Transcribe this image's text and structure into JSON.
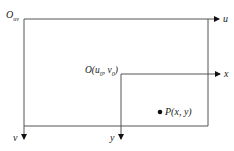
{
  "diagram": {
    "type": "coordinate-frames",
    "world_frame": {
      "origin_label": "O",
      "origin_subscript": "uv",
      "horizontal_axis": "u",
      "vertical_axis": "v"
    },
    "image_frame": {
      "origin_label_prefix": "O(u",
      "origin_sub_1": "0",
      "origin_mid": ", v",
      "origin_sub_2": "0",
      "origin_suffix": ")",
      "horizontal_axis": "x",
      "vertical_axis": "y"
    },
    "point": {
      "label": "P(x, y)"
    },
    "colors": {
      "line": "#555555",
      "text": "#222222",
      "dot": "#111111"
    }
  }
}
